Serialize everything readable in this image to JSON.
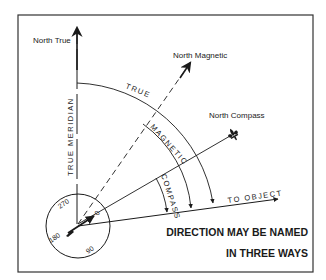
{
  "figure": {
    "title_line1": "DIRECTION MAY BE NAMED",
    "title_line2": "IN THREE WAYS",
    "labels": {
      "north_true": "North True",
      "north_magnetic": "North Magnetic",
      "north_compass": "North Compass",
      "true_meridian": "TRUE MERIDIAN",
      "to_object": "TO OBJECT",
      "arc_true": "TRUE",
      "arc_magnetic": "MAGNETIC",
      "arc_compass": "COMPASS"
    },
    "compass_card": {
      "deg_0": "0",
      "deg_90": "90",
      "deg_180": "180",
      "deg_270": "270"
    },
    "colors": {
      "ink": "#1a1a1a",
      "background": "#ffffff"
    }
  }
}
